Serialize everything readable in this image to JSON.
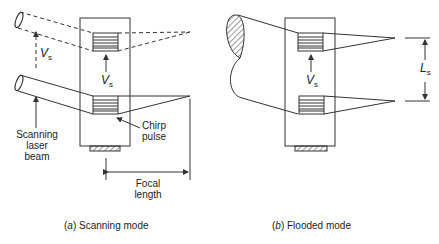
{
  "panel_a": {
    "labels": {
      "velocity_symbol": "V",
      "velocity_subscript": "s",
      "scanning_laser_beam_line1": "Scanning",
      "scanning_laser_beam_line2": "laser",
      "scanning_laser_beam_line3": "beam",
      "chirp_pulse_line1": "Chirp",
      "chirp_pulse_line2": "pulse",
      "focal_length_line1": "Focal",
      "focal_length_line2": "length"
    },
    "caption_letter": "a",
    "caption_text": "Scanning mode"
  },
  "panel_b": {
    "labels": {
      "velocity_symbol": "V",
      "velocity_subscript": "s",
      "spacing_symbol": "L",
      "spacing_subscript": "s"
    },
    "caption_letter": "b",
    "caption_text": "Flooded mode"
  },
  "colors": {
    "line": "#333333",
    "background": "#ffffff"
  }
}
